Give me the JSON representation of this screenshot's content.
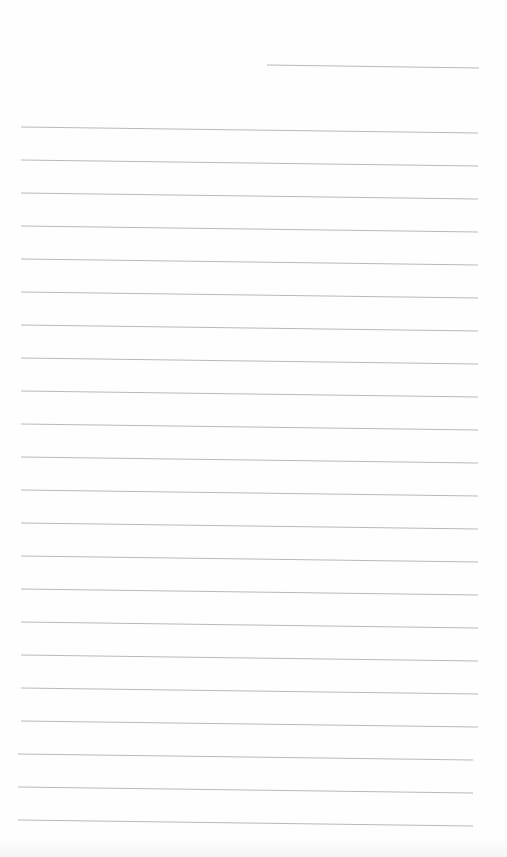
{
  "page": {
    "type": "blank-lined-sheet",
    "line_color": "#b9b9b9",
    "background": "#fefefe",
    "header_line": {
      "x1": 267,
      "y1": 65,
      "x2": 479,
      "y2": 68
    },
    "ruled_lines": {
      "count": 22,
      "first_y": 127,
      "spacing": 33,
      "x1": 21,
      "x2": 478,
      "slope_px": 6
    },
    "text_lines": []
  }
}
